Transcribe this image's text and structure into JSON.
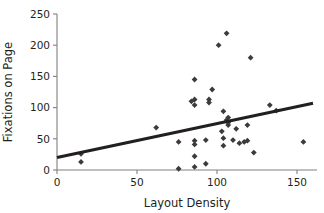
{
  "chart_data": {
    "type": "scatter",
    "title": "",
    "xlabel": "Layout Density",
    "ylabel": "Fixations on Page",
    "xlim": [
      0,
      160
    ],
    "ylim": [
      0,
      250
    ],
    "xticks": [
      0,
      50,
      100,
      150
    ],
    "yticks": [
      0,
      50,
      100,
      150,
      200,
      250
    ],
    "grid": false,
    "legend": null,
    "marker_style": "diamond",
    "marker_color": "#3b3b3f",
    "trendline_color": "#231f20",
    "axis_color": "#808080",
    "points": [
      {
        "x": 15,
        "y": 26
      },
      {
        "x": 15,
        "y": 13
      },
      {
        "x": 62,
        "y": 68
      },
      {
        "x": 76,
        "y": 45
      },
      {
        "x": 76,
        "y": 2
      },
      {
        "x": 84,
        "y": 110
      },
      {
        "x": 86,
        "y": 145
      },
      {
        "x": 86,
        "y": 113
      },
      {
        "x": 86,
        "y": 104
      },
      {
        "x": 86,
        "y": 47
      },
      {
        "x": 86,
        "y": 41
      },
      {
        "x": 86,
        "y": 22
      },
      {
        "x": 86,
        "y": 5
      },
      {
        "x": 93,
        "y": 48
      },
      {
        "x": 93,
        "y": 10
      },
      {
        "x": 95,
        "y": 113
      },
      {
        "x": 95,
        "y": 108
      },
      {
        "x": 97,
        "y": 129
      },
      {
        "x": 101,
        "y": 200
      },
      {
        "x": 103,
        "y": 62
      },
      {
        "x": 104,
        "y": 94
      },
      {
        "x": 104,
        "y": 51
      },
      {
        "x": 104,
        "y": 39
      },
      {
        "x": 106,
        "y": 219
      },
      {
        "x": 106,
        "y": 80
      },
      {
        "x": 107,
        "y": 84
      },
      {
        "x": 107,
        "y": 76
      },
      {
        "x": 107,
        "y": 72
      },
      {
        "x": 110,
        "y": 48
      },
      {
        "x": 112,
        "y": 66
      },
      {
        "x": 114,
        "y": 43
      },
      {
        "x": 117,
        "y": 45
      },
      {
        "x": 119,
        "y": 72
      },
      {
        "x": 119,
        "y": 47
      },
      {
        "x": 121,
        "y": 180
      },
      {
        "x": 123,
        "y": 28
      },
      {
        "x": 133,
        "y": 104
      },
      {
        "x": 137,
        "y": 95
      },
      {
        "x": 154,
        "y": 45
      }
    ],
    "trendline": {
      "x0": 0,
      "y0": 20,
      "x1": 160,
      "y1": 107
    }
  }
}
